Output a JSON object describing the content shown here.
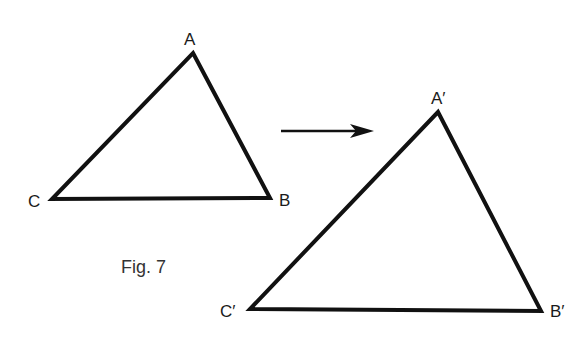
{
  "figure": {
    "caption": "Fig. 7",
    "stroke_color": "#111111",
    "original_triangle": {
      "labels": {
        "A": "A",
        "B": "B",
        "C": "C"
      },
      "points": {
        "A": [
          193,
          53
        ],
        "B": [
          270,
          198
        ],
        "C": [
          52,
          199
        ]
      }
    },
    "image_triangle": {
      "labels": {
        "A": "A′",
        "B": "B′",
        "C": "C′"
      },
      "points": {
        "A": [
          438,
          112
        ],
        "B": [
          541,
          311
        ],
        "C": [
          250,
          309
        ]
      }
    },
    "arrow": {
      "from": [
        281,
        131
      ],
      "to": [
        373,
        131
      ],
      "meaning": "maps-to"
    }
  }
}
